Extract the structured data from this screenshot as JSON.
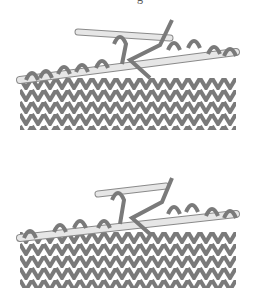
{
  "caption_fragment": "g",
  "illustrations": [
    {
      "id": "step-1",
      "description": "Right needle inserted into stitch on left needle, knit fabric below"
    },
    {
      "id": "step-2",
      "description": "Stitch being slipped/worked with yarn crossing, knit fabric below"
    }
  ],
  "colors": {
    "yarn": "#7a7a7a",
    "yarn_dark": "#5e5e5e",
    "needle": "#e6e6e6",
    "needle_outline": "#8a8a8a",
    "background": "#ffffff"
  }
}
